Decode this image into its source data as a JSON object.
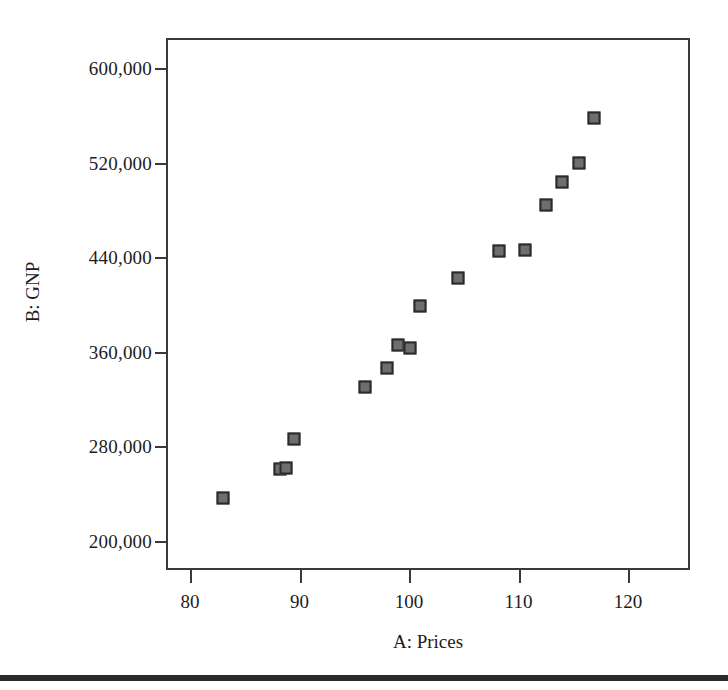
{
  "chart_data": {
    "type": "scatter",
    "title": "",
    "xlabel": "A: Prices",
    "ylabel": "B: GNP",
    "xlim": [
      76,
      122
    ],
    "ylim": [
      175000,
      625000
    ],
    "xticks": [
      80,
      90,
      100,
      110,
      120
    ],
    "xticklabels": [
      "80",
      "90",
      "100",
      "110",
      "120"
    ],
    "yticks": [
      200000,
      280000,
      360000,
      440000,
      520000,
      600000
    ],
    "yticklabels": [
      "200,000",
      "280,000",
      "360,000",
      "440,000",
      "520,000",
      "600,000"
    ],
    "grid": false,
    "legend": null,
    "marker_style": "filled-square",
    "marker_fill": "#6e6e6e",
    "marker_edge": "#2b2b2b",
    "points": [
      {
        "x": 83.0,
        "y": 236000
      },
      {
        "x": 88.2,
        "y": 261000
      },
      {
        "x": 88.8,
        "y": 262000
      },
      {
        "x": 89.5,
        "y": 286000
      },
      {
        "x": 96.0,
        "y": 330000
      },
      {
        "x": 98.0,
        "y": 346000
      },
      {
        "x": 99.0,
        "y": 366000
      },
      {
        "x": 100.1,
        "y": 363000
      },
      {
        "x": 101.0,
        "y": 399000
      },
      {
        "x": 104.5,
        "y": 422000
      },
      {
        "x": 108.2,
        "y": 445000
      },
      {
        "x": 110.6,
        "y": 446000
      },
      {
        "x": 112.5,
        "y": 484000
      },
      {
        "x": 114.0,
        "y": 504000
      },
      {
        "x": 115.5,
        "y": 520000
      },
      {
        "x": 116.9,
        "y": 558000
      }
    ]
  },
  "figure": {
    "background": "#ffffff",
    "frame_color": "#3a3a3a",
    "text_color": "#1c1c1c",
    "rule_color": "#2a2a2a"
  }
}
